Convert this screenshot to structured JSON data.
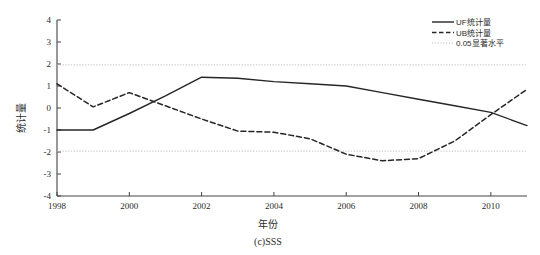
{
  "figure": {
    "caption": "(c)SSS",
    "background_color": "#ffffff",
    "line_color": "#262626",
    "threshold_color": "#bdbdbd",
    "axis_color": "#444444"
  },
  "axes": {
    "ylabel": "统计量",
    "xlabel": "年份",
    "x_ticks": [
      "1998",
      "2000",
      "2002",
      "2004",
      "2006",
      "2008",
      "2010"
    ],
    "y_ticks": [
      "4",
      "3",
      "2",
      "1",
      "0",
      "-1",
      "-2",
      "-3",
      "-4"
    ]
  },
  "legend": {
    "entries": [
      {
        "label": "UF统计量",
        "style": "solid"
      },
      {
        "label": "UB统计量",
        "style": "dashed"
      },
      {
        "label": "0.05显著水平",
        "style": "dotted"
      }
    ]
  },
  "chart_data": {
    "type": "line",
    "title": "",
    "subtitle": "",
    "caption": "(c)SSS",
    "xlabel": "年份",
    "ylabel": "统计量",
    "xlim": [
      1998,
      2011
    ],
    "ylim": [
      -4,
      4
    ],
    "grid": false,
    "legend_position": "top-right",
    "x": [
      1998,
      1999,
      2000,
      2001,
      2002,
      2003,
      2004,
      2005,
      2006,
      2007,
      2008,
      2009,
      2010,
      2011
    ],
    "series": [
      {
        "name": "UF统计量",
        "style": "solid",
        "values": [
          -1.0,
          -1.0,
          -0.25,
          0.55,
          1.4,
          1.35,
          1.2,
          1.1,
          1.0,
          0.7,
          0.4,
          0.1,
          -0.2,
          -0.8
        ]
      },
      {
        "name": "UB统计量",
        "style": "dashed",
        "values": [
          1.1,
          0.05,
          0.7,
          0.1,
          -0.5,
          -1.05,
          -1.1,
          -1.4,
          -2.1,
          -2.4,
          -2.3,
          -1.5,
          -0.3,
          0.85
        ]
      }
    ],
    "threshold_lines": [
      {
        "name": "0.05显著水平",
        "value": 1.96,
        "style": "dotted"
      },
      {
        "name": "0.05显著水平",
        "value": -1.96,
        "style": "dotted"
      }
    ],
    "annotations": []
  }
}
